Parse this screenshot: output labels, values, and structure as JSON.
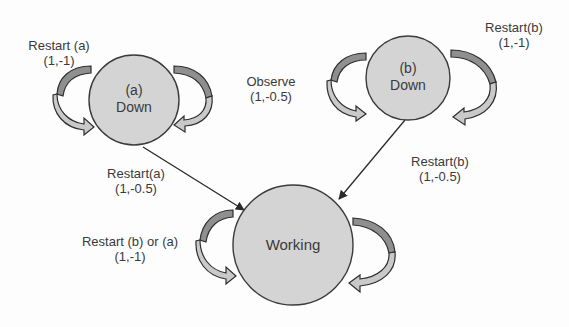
{
  "diagram": {
    "type": "state-transition",
    "nodes": [
      {
        "id": "down_a",
        "line1": "(a)",
        "line2": "Down"
      },
      {
        "id": "down_b",
        "line1": "(b)",
        "line2": "Down"
      },
      {
        "id": "working",
        "line1": "Working"
      }
    ],
    "edges": [
      {
        "from": "down_a",
        "to": "down_a",
        "action": "Restart (a)",
        "value": "(1,-1)"
      },
      {
        "from": "down_a",
        "to": "down_b",
        "action": "Observe",
        "value": "(1,-0.5)"
      },
      {
        "from": "down_b",
        "to": "down_b",
        "action": "Restart(b)",
        "value": "(1,-1)"
      },
      {
        "from": "down_a",
        "to": "working",
        "action": "Restart(a)",
        "value": "(1,-0.5)"
      },
      {
        "from": "down_b",
        "to": "working",
        "action": "Restart(b)",
        "value": "(1,-0.5)"
      },
      {
        "from": "working",
        "to": "working",
        "action": "Restart (b) or (a)",
        "value": "(1,-1)"
      }
    ]
  },
  "colors": {
    "node_fill": "#d4d4d4",
    "node_stroke": "#3a3a3a",
    "loop_dark": "#8f8f8f",
    "loop_light": "#c9c9c9",
    "text": "#3a3a3a"
  }
}
